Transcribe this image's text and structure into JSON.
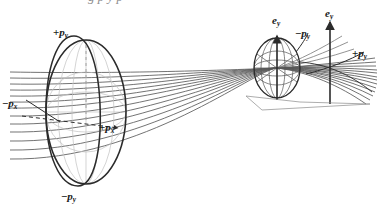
{
  "figure": {
    "background": "#ffffff",
    "ink_color": "#2b2b2b",
    "ray_color": "#555555",
    "faint_color": "#b9b9b9",
    "width": 380,
    "height": 219
  },
  "cropped_text_top": "g       p                 y       p",
  "labels": {
    "large_ellipsoid_top": {
      "sign": "+",
      "symbol": "p",
      "subscript": "y",
      "text": "+py"
    },
    "large_ellipsoid_left": {
      "sign": "−",
      "symbol": "p",
      "subscript": "x",
      "text": "−px"
    },
    "large_ellipsoid_center": {
      "sign": "+",
      "symbol": "p",
      "subscript": "x",
      "text": "+px"
    },
    "large_ellipsoid_bottom": {
      "sign": "−",
      "symbol": "p",
      "subscript": "y",
      "text": "−py"
    },
    "small_ellipsoid_axis": {
      "symbol": "e",
      "subscript": "y",
      "text": "ey"
    },
    "small_ellipsoid_neg_py": {
      "sign": "−",
      "symbol": "p",
      "subscript": "y",
      "text": "−py"
    },
    "right_axis": {
      "symbol": "e",
      "subscript": "y",
      "text": "ey"
    },
    "right_pos_py": {
      "sign": "+",
      "symbol": "p",
      "subscript": "y",
      "text": "+py"
    }
  },
  "elements": {
    "large_ellipsoid": {
      "name": "large-phase-ellipsoid",
      "cx": 86,
      "cy": 112,
      "rx": 40,
      "ry": 72
    },
    "small_ellipsoid": {
      "name": "small-phase-ellipsoid",
      "cx": 277,
      "cy": 68,
      "rx": 23,
      "ry": 30
    },
    "ray_bundle": {
      "name": "converging-ray-bundle",
      "count": 13
    },
    "waist": {
      "name": "beam-waist",
      "x": 277,
      "y": 68
    }
  }
}
